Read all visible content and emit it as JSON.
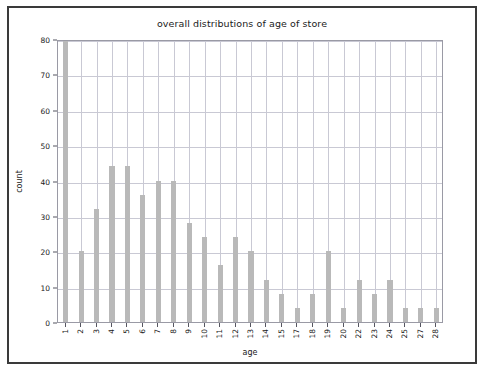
{
  "chart_data": {
    "type": "bar",
    "title": "overall distributions of age of store",
    "xlabel": "age",
    "ylabel": "count",
    "categories": [
      "1",
      "2",
      "3",
      "4",
      "5",
      "6",
      "7",
      "8",
      "9",
      "10",
      "11",
      "12",
      "13",
      "14",
      "15",
      "17",
      "18",
      "19",
      "20",
      "22",
      "23",
      "24",
      "25",
      "27",
      "28"
    ],
    "values": [
      80,
      20,
      32,
      44,
      44,
      36,
      40,
      40,
      28,
      24,
      16,
      24,
      20,
      12,
      8,
      4,
      8,
      20,
      4,
      12,
      8,
      12,
      4,
      4,
      4
    ],
    "ylim": [
      0,
      80
    ],
    "yticks": [
      0,
      10,
      20,
      30,
      40,
      50,
      60,
      70,
      80
    ],
    "ytick_labels": [
      "0",
      "10",
      "20",
      "30",
      "40",
      "50",
      "60",
      "70",
      "80"
    ],
    "grid": true,
    "legend": null,
    "bar_color": "#b9b9b9",
    "grid_color": "#c9c9d4",
    "axes_color": "#9a9aa5",
    "background": "#ffffff"
  }
}
